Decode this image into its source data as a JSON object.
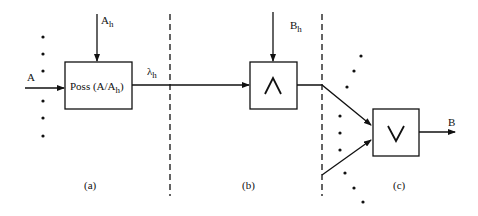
{
  "diagram": {
    "panels": [
      {
        "id": "a",
        "caption": "(a)"
      },
      {
        "id": "b",
        "caption": "(b)"
      },
      {
        "id": "c",
        "caption": "(c)"
      }
    ],
    "nodes": {
      "poss_box": {
        "label_main": "Poss (A/A",
        "label_sub": "h",
        "label_close": ")"
      },
      "and_box": {
        "symbol": "∧"
      },
      "or_box": {
        "symbol": "∨"
      }
    },
    "labels": {
      "input_a": "A",
      "input_ah_main": "A",
      "input_ah_sub": "h",
      "lambda_main": "λ",
      "lambda_sub": "h",
      "input_bh_main": "B",
      "input_bh_sub": "h",
      "output_b": "B"
    },
    "colors": {
      "stroke": "#111111",
      "background": "#ffffff"
    }
  }
}
